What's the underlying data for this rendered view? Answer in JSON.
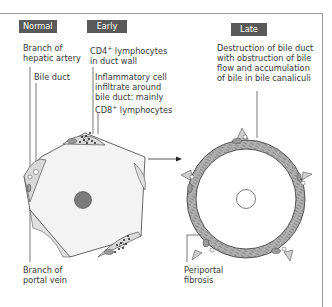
{
  "stages": {
    "normal": "Normal",
    "early": "Early",
    "late": "Late"
  },
  "labels": {
    "branch_hepatic_artery": "Branch of\nhepatic artery",
    "bile_duct": "Bile duct",
    "cd4_prefix": "CD4",
    "cd4_suffix": " lymphocytes\nin duct wall",
    "infiltrate_text": "Inflammatory cell\ninfiltrate around\nbile duct: mainly",
    "cd8_prefix": "CD8",
    "cd8_suffix": " lymphocytes",
    "plus": "+",
    "central_vein": "Central vein",
    "branch_portal_vein": "Branch of\nportal vein",
    "late_description": "Destruction of bile duct\nwith obstruction of bile\nflow and accumulation\nof bile in bile canaliculi",
    "periportal_fibrosis": "Periportal\nfibrosis"
  },
  "colors": {
    "tag_bg": "#5a5a5a",
    "lobule_fill": "#f3f3f3",
    "portal_fill": "#d8d8d8",
    "central_vein": "#7a7a7a",
    "fibrosis_ring": "#a9a9a9",
    "outline": "#555555"
  }
}
